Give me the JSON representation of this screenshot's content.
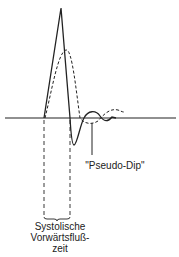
{
  "diagram": {
    "labels": {
      "pseudo_dip": "\"Pseudo-Dip\"",
      "systolic_line1": "Systolische",
      "systolic_line2": "Vorwärtsfluß-",
      "systolic_line3": "zeit"
    },
    "colors": {
      "stroke": "#222222",
      "background": "#ffffff"
    },
    "series": [
      {
        "name": "solid-waveform",
        "style": "solid"
      },
      {
        "name": "dashed-waveform",
        "style": "dashed"
      }
    ]
  }
}
